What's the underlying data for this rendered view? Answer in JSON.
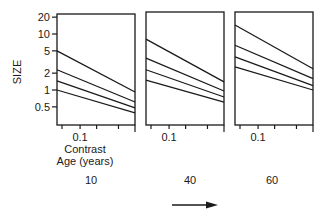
{
  "chart_data": {
    "type": "line",
    "title": "",
    "ylabel": "SIZE",
    "xlabel": "Contrast",
    "panel_label_title": "Age (years)",
    "yscale": "log",
    "xscale": "log",
    "ylim": [
      0.24,
      25
    ],
    "xlim": [
      0.038,
      1
    ],
    "yticks": [
      {
        "value": 20,
        "label": "20"
      },
      {
        "value": 10,
        "label": "10"
      },
      {
        "value": 5,
        "label": "5"
      },
      {
        "value": 2,
        "label": "2"
      },
      {
        "value": 1,
        "label": "1"
      },
      {
        "value": 0.5,
        "label": "0.5"
      }
    ],
    "xticks": [
      {
        "value": 0.1,
        "label": "0.1"
      },
      {
        "value": 0.2,
        "label": ""
      },
      {
        "value": 0.5,
        "label": ""
      },
      {
        "value": 1,
        "label": ""
      }
    ],
    "grid": false,
    "legend": null,
    "panels": [
      {
        "age": "10",
        "series": [
          {
            "name": "line-1",
            "x": [
              0.038,
              1
            ],
            "values": [
              5.0,
              0.92
            ]
          },
          {
            "name": "line-2",
            "x": [
              0.038,
              1
            ],
            "values": [
              2.3,
              0.61
            ]
          },
          {
            "name": "line-3",
            "x": [
              0.038,
              1
            ],
            "values": [
              1.45,
              0.48
            ]
          },
          {
            "name": "line-4",
            "x": [
              0.038,
              1
            ],
            "values": [
              1.0,
              0.39
            ]
          }
        ]
      },
      {
        "age": "40",
        "series": [
          {
            "name": "line-1",
            "x": [
              0.038,
              1
            ],
            "values": [
              8.1,
              1.4
            ]
          },
          {
            "name": "line-2",
            "x": [
              0.038,
              1
            ],
            "values": [
              3.7,
              0.96
            ]
          },
          {
            "name": "line-3",
            "x": [
              0.038,
              1
            ],
            "values": [
              2.3,
              0.75
            ]
          },
          {
            "name": "line-4",
            "x": [
              0.038,
              1
            ],
            "values": [
              1.5,
              0.61
            ]
          }
        ]
      },
      {
        "age": "60",
        "series": [
          {
            "name": "line-1",
            "x": [
              0.038,
              1
            ],
            "values": [
              14.5,
              2.4
            ]
          },
          {
            "name": "line-2",
            "x": [
              0.038,
              1
            ],
            "values": [
              6.3,
              1.6
            ]
          },
          {
            "name": "line-3",
            "x": [
              0.038,
              1
            ],
            "values": [
              3.9,
              1.2
            ]
          },
          {
            "name": "line-4",
            "x": [
              0.038,
              1
            ],
            "values": [
              2.6,
              1.0
            ]
          }
        ]
      }
    ],
    "annotations": [
      "arrow pointing right (increasing age)"
    ]
  },
  "labels": {
    "ylabel": "SIZE",
    "xlabel": "Contrast",
    "age_title": "Age (years)",
    "x_tick_01": "0.1",
    "ages": [
      "10",
      "40",
      "60"
    ],
    "yticks": [
      "20",
      "10",
      "5",
      "2",
      "1",
      "0.5"
    ]
  }
}
